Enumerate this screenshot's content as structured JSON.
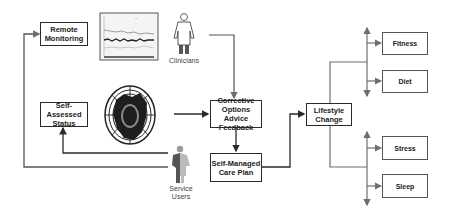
{
  "diagram": {
    "nodes": {
      "remote_monitoring": "Remote\nMonitoring",
      "self_assessed_status": "Self-Assessed\nStatus",
      "corrective_options": "Corrective\nOptions Advice\nFeedback",
      "self_managed_care_plan": "Self-Managed\nCare Plan",
      "lifestyle_change": "Lifestyle\nChange",
      "fitness": "Fitness",
      "diet": "Diet",
      "stress": "Stress",
      "sleep": "Sleep"
    },
    "actors": {
      "clinicians": "Clinicians",
      "service_users": "Service\nUsers"
    },
    "images": {
      "monitoring_chart": "monitoring-chart-image",
      "globe": "body-map-globe-image"
    },
    "edges": [
      {
        "from": "clinicians",
        "to": "corrective_options"
      },
      {
        "from": "globe",
        "to": "corrective_options"
      },
      {
        "from": "corrective_options",
        "to": "self_managed_care_plan"
      },
      {
        "from": "self_managed_care_plan",
        "to": "lifestyle_change"
      },
      {
        "from": "self_managed_care_plan",
        "to": "self_assessed_status"
      },
      {
        "from": "service_users",
        "to": "remote_monitoring"
      },
      {
        "from": "lifestyle_change",
        "to": "fitness"
      },
      {
        "from": "lifestyle_change",
        "to": "diet"
      },
      {
        "from": "lifestyle_change",
        "to": "stress"
      },
      {
        "from": "lifestyle_change",
        "to": "sleep"
      }
    ],
    "colors": {
      "line_dark": "#2a2a2a",
      "line_gray": "#6e6e6e",
      "border": "#2a2a2a"
    }
  }
}
